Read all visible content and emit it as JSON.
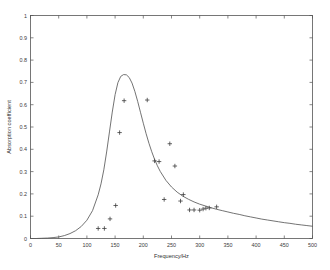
{
  "chart_data": {
    "type": "scatter",
    "title": "",
    "xlabel": "Frequency/Hz",
    "ylabel": "Absorption coefficient",
    "xlim": [
      0,
      500
    ],
    "ylim": [
      0,
      1
    ],
    "grid": false,
    "legend": null,
    "xticks": [
      0,
      50,
      100,
      150,
      200,
      250,
      300,
      350,
      400,
      450,
      500
    ],
    "xtick_labels": [
      "0",
      "50",
      "100",
      "150",
      "200",
      "250",
      "300",
      "350",
      "400",
      "450",
      "500"
    ],
    "yticks": [
      0,
      0.1,
      0.2,
      0.3,
      0.4,
      0.5,
      0.6,
      0.7,
      0.8,
      0.9,
      1
    ],
    "ytick_labels": [
      "0",
      "0.1",
      "0.2",
      "0.3",
      "0.4",
      "0.5",
      "0.6",
      "0.7",
      "0.8",
      "0.9",
      "1"
    ],
    "series": [
      {
        "name": "Model curve",
        "type": "line",
        "marker": "none",
        "color": "#5a5a5a",
        "x": [
          0,
          10,
          20,
          30,
          40,
          50,
          60,
          70,
          80,
          90,
          100,
          110,
          120,
          125,
          130,
          135,
          140,
          145,
          150,
          155,
          160,
          165,
          170,
          175,
          180,
          185,
          190,
          195,
          200,
          205,
          210,
          215,
          220,
          225,
          230,
          240,
          250,
          260,
          270,
          280,
          290,
          300,
          310,
          320,
          330,
          340,
          350,
          360,
          370,
          380,
          390,
          400,
          410,
          420,
          430,
          440,
          450,
          460,
          470,
          480,
          490,
          500
        ],
        "y": [
          0.0,
          0.0,
          0.001,
          0.002,
          0.004,
          0.007,
          0.013,
          0.022,
          0.035,
          0.054,
          0.082,
          0.125,
          0.196,
          0.245,
          0.308,
          0.388,
          0.478,
          0.567,
          0.645,
          0.699,
          0.727,
          0.735,
          0.734,
          0.722,
          0.697,
          0.66,
          0.615,
          0.566,
          0.517,
          0.47,
          0.427,
          0.389,
          0.355,
          0.326,
          0.301,
          0.261,
          0.231,
          0.208,
          0.19,
          0.176,
          0.164,
          0.154,
          0.146,
          0.138,
          0.131,
          0.125,
          0.119,
          0.113,
          0.108,
          0.102,
          0.097,
          0.092,
          0.087,
          0.083,
          0.079,
          0.075,
          0.071,
          0.068,
          0.064,
          0.061,
          0.058,
          0.055
        ]
      },
      {
        "name": "Measured data",
        "type": "scatter",
        "marker": "plus",
        "color": "#3c3c3c",
        "points": [
          {
            "x": 120,
            "y": 0.045
          },
          {
            "x": 131,
            "y": 0.045
          },
          {
            "x": 141,
            "y": 0.088
          },
          {
            "x": 151,
            "y": 0.148
          },
          {
            "x": 158,
            "y": 0.475
          },
          {
            "x": 166,
            "y": 0.618
          },
          {
            "x": 207,
            "y": 0.621
          },
          {
            "x": 220,
            "y": 0.348
          },
          {
            "x": 228,
            "y": 0.345
          },
          {
            "x": 237,
            "y": 0.175
          },
          {
            "x": 247,
            "y": 0.425
          },
          {
            "x": 256,
            "y": 0.325
          },
          {
            "x": 266,
            "y": 0.168
          },
          {
            "x": 271,
            "y": 0.197
          },
          {
            "x": 282,
            "y": 0.128
          },
          {
            "x": 290,
            "y": 0.128
          },
          {
            "x": 300,
            "y": 0.127
          },
          {
            "x": 306,
            "y": 0.132
          },
          {
            "x": 311,
            "y": 0.136
          },
          {
            "x": 317,
            "y": 0.137
          },
          {
            "x": 330,
            "y": 0.142
          }
        ]
      }
    ]
  }
}
